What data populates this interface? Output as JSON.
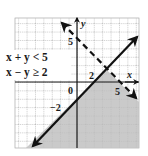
{
  "figure": {
    "type": "system-of-linear-inequalities-graph",
    "inequalities": [
      {
        "text": "x + y < 5",
        "boundary": "x + y = 5",
        "line_style": "dashed"
      },
      {
        "text": "x − y ≥ 2",
        "boundary": "x − y = 2",
        "line_style": "solid"
      }
    ],
    "axes": {
      "x_label": "x",
      "y_label": "y",
      "origin_label": "0",
      "tick_labels": {
        "y_axis_5": "5",
        "y_axis_neg2": "−2",
        "x_axis_5": "5",
        "x_axis_2": "2",
        "line_label_2": "2"
      }
    },
    "shading": {
      "region": "x - y >= 2 and x + y < 5",
      "color": "#c4c4c4"
    },
    "colors": {
      "grid": "#9a9a9a",
      "axes": "#1a1a1a",
      "lines": "#111111",
      "background": "#ffffff"
    }
  }
}
